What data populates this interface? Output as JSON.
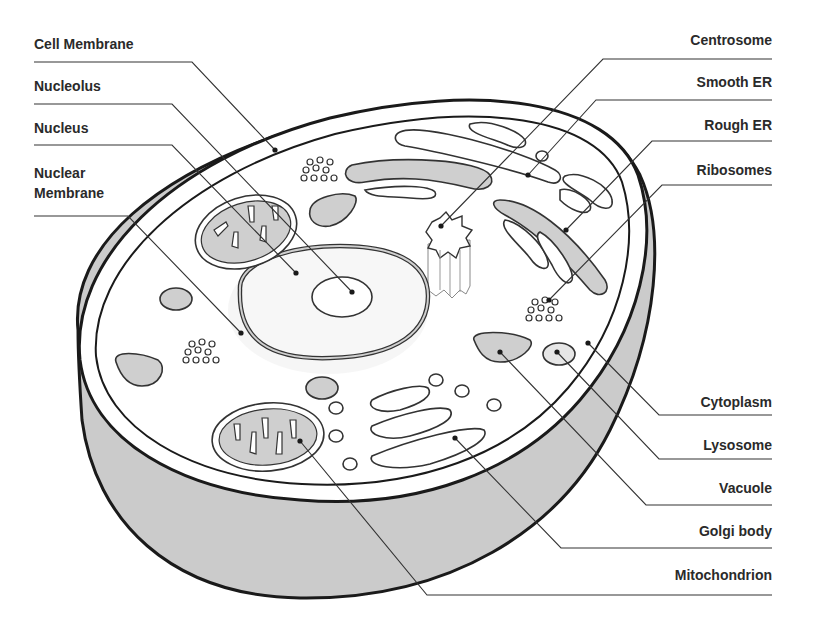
{
  "diagram": {
    "colors": {
      "outline": "#1a1a1a",
      "organelle_fill": "#cfcfcf",
      "cytoplasm": "#ffffff",
      "cell_side": "#cbcbcb",
      "leader_line": "#333333",
      "label_text": "#2a2a2a"
    },
    "labels_left": [
      {
        "id": "cell-membrane",
        "text": "Cell Membrane"
      },
      {
        "id": "nucleolus",
        "text": "Nucleolus"
      },
      {
        "id": "nucleus",
        "text": "Nucleus"
      },
      {
        "id": "nuclear-membrane-line1",
        "text": "Nuclear"
      },
      {
        "id": "nuclear-membrane-line2",
        "text": "Membrane"
      }
    ],
    "labels_right": [
      {
        "id": "centrosome",
        "text": "Centrosome"
      },
      {
        "id": "smooth-er",
        "text": "Smooth ER"
      },
      {
        "id": "rough-er",
        "text": "Rough ER"
      },
      {
        "id": "ribosomes",
        "text": "Ribosomes"
      },
      {
        "id": "cytoplasm",
        "text": "Cytoplasm"
      },
      {
        "id": "lysosome",
        "text": "Lysosome"
      },
      {
        "id": "vacuole",
        "text": "Vacuole"
      },
      {
        "id": "golgi-body",
        "text": "Golgi body"
      },
      {
        "id": "mitochondrion",
        "text": "Mitochondrion"
      }
    ]
  }
}
